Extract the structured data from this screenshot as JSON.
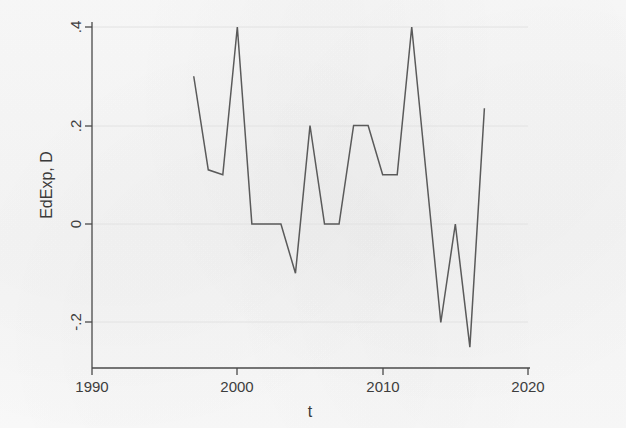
{
  "figure": {
    "background_color": "#f8f8f8",
    "line_color": "#5a5a5a",
    "grid_color": "#e2e2e2",
    "axis_color": "#4a4a4a"
  },
  "axes": {
    "y_title": "EdExp, D",
    "x_title": "t",
    "y_ticks": [
      ".4",
      ".2",
      "0",
      "-.2"
    ],
    "x_ticks": [
      "1990",
      "2000",
      "2010",
      "2020"
    ]
  },
  "chart_data": {
    "type": "line",
    "title": "",
    "subtitle": "",
    "xlabel": "t",
    "ylabel": "EdExp, D",
    "xlim": [
      1990,
      2020
    ],
    "ylim": [
      -0.28,
      0.42
    ],
    "xticks": [
      1990,
      2000,
      2010,
      2020
    ],
    "xticklabels": [
      "1990",
      "2000",
      "2010",
      "2020"
    ],
    "yticks": [
      0.4,
      0.2,
      0,
      -0.2
    ],
    "yticklabels": [
      ".4",
      ".2",
      "0",
      "-.2"
    ],
    "grid": "horizontal",
    "legend": "none",
    "series": [
      {
        "name": "EdExp, D",
        "x": [
          1997,
          1998,
          1999,
          2000,
          2001,
          2002,
          2003,
          2004,
          2005,
          2006,
          2007,
          2008,
          2009,
          2010,
          2011,
          2012,
          2013,
          2014,
          2015,
          2016,
          2017
        ],
        "values": [
          0.3,
          0.11,
          0.1,
          0.4,
          0,
          0,
          0,
          -0.1,
          0.2,
          0,
          0,
          0.2,
          0.2,
          0.1,
          0.1,
          0.4,
          0.1,
          -0.2,
          0,
          -0.25,
          0.235
        ]
      }
    ]
  }
}
